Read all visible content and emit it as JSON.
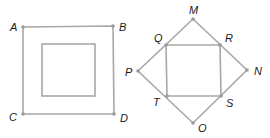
{
  "figures": [
    {
      "name": "square-abcd",
      "points": {
        "A": {
          "label": "A"
        },
        "B": {
          "label": "B"
        },
        "C": {
          "label": "C"
        },
        "D": {
          "label": "D"
        }
      },
      "outer_polygon": [
        "A",
        "B",
        "D",
        "C"
      ],
      "has_inner_square": true
    },
    {
      "name": "square-mnop-with-qrst",
      "points": {
        "M": {
          "label": "M"
        },
        "N": {
          "label": "N"
        },
        "O": {
          "label": "O"
        },
        "P": {
          "label": "P"
        },
        "Q": {
          "label": "Q"
        },
        "R": {
          "label": "R"
        },
        "S": {
          "label": "S"
        },
        "T": {
          "label": "T"
        }
      },
      "outer_polygon": [
        "M",
        "N",
        "O",
        "P"
      ],
      "inner_polygon": [
        "Q",
        "R",
        "S",
        "T"
      ]
    }
  ],
  "colors": {
    "line": "#a8a8a8",
    "point": "#9a9a9a",
    "label": "#1a1a1a",
    "background": "#ffffff"
  }
}
